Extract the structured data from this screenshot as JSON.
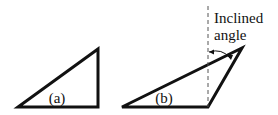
{
  "diagram": {
    "triangle_a": {
      "label": "(a)"
    },
    "triangle_b": {
      "label": "(b)"
    },
    "annotation": {
      "line1": "Inclined",
      "line2": "angle"
    }
  },
  "colors": {
    "stroke": "#111111",
    "dashed": "#555555",
    "background": "#ffffff"
  }
}
